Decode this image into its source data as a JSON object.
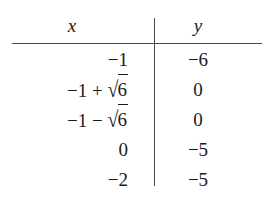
{
  "figure": {
    "kind": "two-column-math-table",
    "headers": {
      "x_label": "x",
      "y_label": "y"
    },
    "rows": [
      {
        "x_prefix": "−1",
        "x_operator": "",
        "x_radical_sign": "",
        "x_radicand": "",
        "y": "−6"
      },
      {
        "x_prefix": "−1",
        "x_operator": "+",
        "x_radical_sign": "√",
        "x_radicand": "6",
        "y": "0"
      },
      {
        "x_prefix": "−1",
        "x_operator": "−",
        "x_radical_sign": "√",
        "x_radicand": "6",
        "y": "0"
      },
      {
        "x_prefix": "0",
        "x_operator": "",
        "x_radical_sign": "",
        "x_radicand": "",
        "y": "−5"
      },
      {
        "x_prefix": "−2",
        "x_operator": "",
        "x_radical_sign": "",
        "x_radicand": "",
        "y": "−5"
      }
    ],
    "colors": {
      "background": "#ffffff",
      "text": "#1a1a1a",
      "rule": "#4a4a4a"
    }
  }
}
